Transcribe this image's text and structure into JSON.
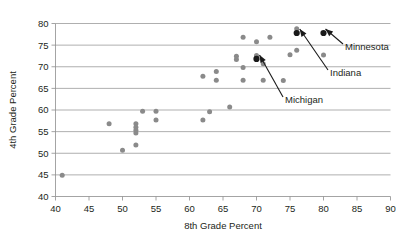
{
  "chart_data": {
    "type": "scatter",
    "title": "",
    "xlabel": "8th Grade Percent",
    "ylabel": "4th Grade Percent",
    "xlim": [
      40,
      90
    ],
    "ylim": [
      40,
      80
    ],
    "xticks": [
      40,
      45,
      50,
      55,
      60,
      65,
      70,
      75,
      80,
      85,
      90
    ],
    "yticks": [
      40,
      45,
      50,
      55,
      60,
      65,
      70,
      75,
      80
    ],
    "grid": "horizontal",
    "legend": "none",
    "point_color": "#8a8a8a",
    "highlight_color": "#1a1a1a",
    "points": [
      {
        "x": 41.0,
        "y": 44.9
      },
      {
        "x": 48.0,
        "y": 56.8
      },
      {
        "x": 50.0,
        "y": 50.7
      },
      {
        "x": 52.0,
        "y": 56.8
      },
      {
        "x": 52.0,
        "y": 56.0
      },
      {
        "x": 52.0,
        "y": 55.3
      },
      {
        "x": 52.0,
        "y": 54.7
      },
      {
        "x": 52.0,
        "y": 51.9
      },
      {
        "x": 53.0,
        "y": 59.7
      },
      {
        "x": 55.0,
        "y": 59.7
      },
      {
        "x": 55.0,
        "y": 57.7
      },
      {
        "x": 62.0,
        "y": 67.8
      },
      {
        "x": 62.0,
        "y": 57.7
      },
      {
        "x": 63.0,
        "y": 59.6
      },
      {
        "x": 64.0,
        "y": 68.9
      },
      {
        "x": 64.0,
        "y": 66.9
      },
      {
        "x": 66.0,
        "y": 60.7
      },
      {
        "x": 67.0,
        "y": 72.4
      },
      {
        "x": 67.0,
        "y": 71.7
      },
      {
        "x": 68.0,
        "y": 76.8
      },
      {
        "x": 68.0,
        "y": 69.8
      },
      {
        "x": 68.0,
        "y": 66.9
      },
      {
        "x": 70.0,
        "y": 75.8
      },
      {
        "x": 70.0,
        "y": 72.6
      },
      {
        "x": 70.0,
        "y": 72.0
      },
      {
        "x": 71.0,
        "y": 70.7
      },
      {
        "x": 71.0,
        "y": 66.9
      },
      {
        "x": 72.0,
        "y": 76.8
      },
      {
        "x": 74.0,
        "y": 66.8
      },
      {
        "x": 75.0,
        "y": 72.8
      },
      {
        "x": 76.0,
        "y": 78.8
      },
      {
        "x": 76.0,
        "y": 73.8
      },
      {
        "x": 80.0,
        "y": 72.7
      }
    ],
    "highlighted_points": [
      {
        "x": 70.0,
        "y": 71.8,
        "label": "Michigan"
      },
      {
        "x": 76.0,
        "y": 77.8,
        "label": "Indiana"
      },
      {
        "x": 80.0,
        "y": 77.8,
        "label": "Minnesota"
      }
    ],
    "annotations": [
      {
        "label": "Michigan",
        "target_x": 70.0,
        "target_y": 71.8
      },
      {
        "label": "Indiana",
        "target_x": 76.0,
        "target_y": 77.8
      },
      {
        "label": "Minnesota",
        "target_x": 80.0,
        "target_y": 77.8
      }
    ]
  }
}
